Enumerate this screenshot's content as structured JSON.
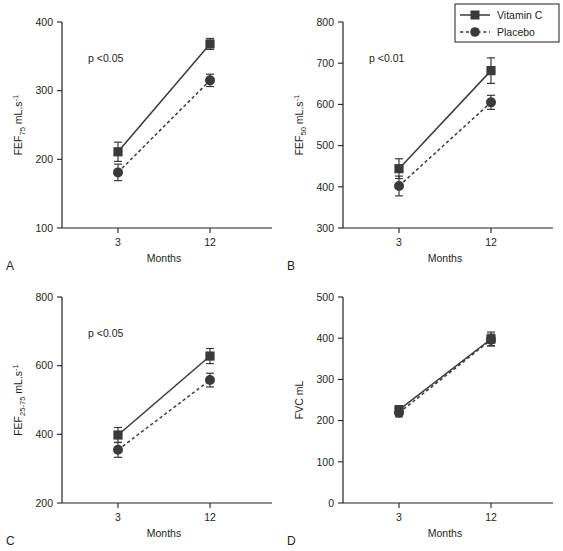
{
  "figure": {
    "title": "",
    "panel_letters": {
      "a": "A",
      "b": "B",
      "c": "C",
      "d": "D"
    },
    "xlabel": "Months",
    "categories": [
      "3",
      "12"
    ],
    "legend": {
      "position": "top-right",
      "entries": [
        {
          "label": "Vitamin C",
          "marker": "square",
          "line": "solid"
        },
        {
          "label": "Placebo",
          "marker": "circle",
          "line": "dashed"
        }
      ]
    },
    "colors": {
      "ink": "#231f20",
      "series": "#3a3a3a",
      "background": "#ffffff"
    }
  },
  "chart_data": [
    {
      "panel": "A",
      "type": "line",
      "title": "",
      "xlabel": "Months",
      "ylabel": "FEF75 mL.s-1",
      "ylabel_parts": {
        "base": "FEF",
        "sub": "75",
        "unit": "mL.s",
        "sup": "-1"
      },
      "annotation": "p <0.05",
      "x": [
        3,
        12
      ],
      "categories": [
        "3",
        "12"
      ],
      "xticks": [
        "3",
        "12"
      ],
      "yticks": [
        100,
        200,
        300,
        400
      ],
      "ytick_labels": [
        "100",
        "200",
        "300",
        "400"
      ],
      "ylim": [
        100,
        400
      ],
      "grid": false,
      "series": [
        {
          "name": "Vitamin C",
          "values": [
            211,
            368
          ],
          "errors": [
            14,
            8
          ],
          "marker": "square",
          "line": "solid"
        },
        {
          "name": "Placebo",
          "values": [
            181,
            315
          ],
          "errors": [
            12,
            9
          ],
          "marker": "circle",
          "line": "dashed"
        }
      ]
    },
    {
      "panel": "B",
      "type": "line",
      "title": "",
      "xlabel": "Months",
      "ylabel": "FEF50 mL.s-1",
      "ylabel_parts": {
        "base": "FEF",
        "sub": "50",
        "unit": "mL.s",
        "sup": "-1"
      },
      "annotation": "p <0.01",
      "x": [
        3,
        12
      ],
      "categories": [
        "3",
        "12"
      ],
      "xticks": [
        "3",
        "12"
      ],
      "yticks": [
        300,
        400,
        500,
        600,
        700,
        800
      ],
      "ytick_labels": [
        "300",
        "400",
        "500",
        "600",
        "700",
        "800"
      ],
      "ylim": [
        300,
        800
      ],
      "grid": false,
      "series": [
        {
          "name": "Vitamin C",
          "values": [
            444,
            682
          ],
          "errors": [
            24,
            31
          ],
          "marker": "square",
          "line": "solid"
        },
        {
          "name": "Placebo",
          "values": [
            402,
            605
          ],
          "errors": [
            24,
            17
          ],
          "marker": "circle",
          "line": "dashed"
        }
      ]
    },
    {
      "panel": "C",
      "type": "line",
      "title": "",
      "xlabel": "Months",
      "ylabel": "FEF25-75 mL.s-1",
      "ylabel_parts": {
        "base": "FEF",
        "sub": "25-75",
        "unit": "mL.s",
        "sup": "-1"
      },
      "annotation": "p <0.05",
      "x": [
        3,
        12
      ],
      "categories": [
        "3",
        "12"
      ],
      "xticks": [
        "3",
        "12"
      ],
      "yticks": [
        200,
        400,
        600,
        800
      ],
      "ytick_labels": [
        "200",
        "400",
        "600",
        "800"
      ],
      "ylim": [
        200,
        800
      ],
      "grid": false,
      "series": [
        {
          "name": "Vitamin C",
          "values": [
            398,
            628
          ],
          "errors": [
            22,
            22
          ],
          "marker": "square",
          "line": "solid"
        },
        {
          "name": "Placebo",
          "values": [
            355,
            558
          ],
          "errors": [
            22,
            20
          ],
          "marker": "circle",
          "line": "dashed"
        }
      ]
    },
    {
      "panel": "D",
      "type": "line",
      "title": "",
      "xlabel": "Months",
      "ylabel": "FVC mL",
      "ylabel_parts": {
        "base": "FVC mL",
        "sub": "",
        "unit": "",
        "sup": ""
      },
      "annotation": "",
      "x": [
        3,
        12
      ],
      "categories": [
        "3",
        "12"
      ],
      "xticks": [
        "3",
        "12"
      ],
      "yticks": [
        0,
        100,
        200,
        300,
        400,
        500
      ],
      "ytick_labels": [
        "0",
        "100",
        "200",
        "300",
        "400",
        "500"
      ],
      "ylim": [
        0,
        500
      ],
      "grid": false,
      "series": [
        {
          "name": "Vitamin C",
          "values": [
            226,
            398
          ],
          "errors": [
            10,
            17
          ],
          "marker": "square",
          "line": "solid"
        },
        {
          "name": "Placebo",
          "values": [
            219,
            396
          ],
          "errors": [
            10,
            14
          ],
          "marker": "circle",
          "line": "dashed"
        }
      ]
    }
  ]
}
